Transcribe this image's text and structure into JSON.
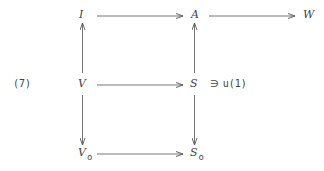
{
  "equation_label": "(7)",
  "nodes": {
    "I": {
      "label": "I"
    },
    "A": {
      "label": "A"
    },
    "W": {
      "label": "W"
    },
    "V": {
      "label": "V"
    },
    "S": {
      "label": "S"
    },
    "V0": {
      "label": "V",
      "sub": "o"
    },
    "S0": {
      "label": "S",
      "sub": "o"
    }
  },
  "annotation": {
    "symbol": "∋",
    "value": "u(1)"
  },
  "arrows": [
    {
      "from": "I",
      "to": "A",
      "direction": "right"
    },
    {
      "from": "A",
      "to": "W",
      "direction": "right"
    },
    {
      "from": "V",
      "to": "I",
      "direction": "up"
    },
    {
      "from": "S",
      "to": "A",
      "direction": "up"
    },
    {
      "from": "V",
      "to": "S",
      "direction": "right"
    },
    {
      "from": "V",
      "to": "V0",
      "direction": "down"
    },
    {
      "from": "S",
      "to": "S0",
      "direction": "down"
    },
    {
      "from": "V0",
      "to": "S0",
      "direction": "right"
    }
  ],
  "colors": {
    "stroke": "#555555",
    "text": "#444444",
    "background": "#ffffff"
  }
}
